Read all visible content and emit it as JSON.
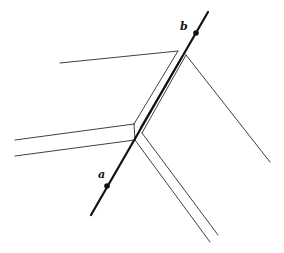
{
  "figure": {
    "labels": {
      "point_a": "a",
      "point_b": "b"
    },
    "colors": {
      "line": "#111111",
      "edge": "#2a2a2a",
      "background": "#ffffff"
    }
  }
}
